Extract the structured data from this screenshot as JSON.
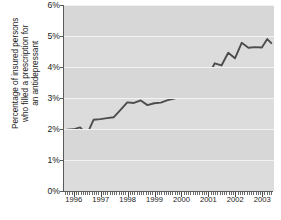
{
  "chart_data": {
    "type": "line",
    "title": "",
    "subtitle": "",
    "xlabel": "",
    "ylabel": "Percentage of insured persons who filled a prescription for an antidepressant",
    "ylabel_lines": [
      "Percentage of insured persons",
      "who filled a prescription for",
      "an antidepressant"
    ],
    "ylim": [
      0,
      6
    ],
    "ytick_labels": [
      "0%",
      "1%",
      "2%",
      "3%",
      "4%",
      "5%",
      "6%"
    ],
    "ytick_values": [
      0,
      1,
      2,
      3,
      4,
      5,
      6
    ],
    "xlim": [
      1995.6,
      2003.4
    ],
    "xtick_labels": [
      "1996",
      "1997",
      "1998",
      "1999",
      "2000",
      "2001",
      "2002",
      "2003"
    ],
    "xtick_values": [
      1996,
      1997,
      1998,
      1999,
      2000,
      2001,
      2002,
      2003
    ],
    "grid": "horizontal-white",
    "legend": "none",
    "line_color": "#4d4d4d",
    "plot_background": "#dcdcdc",
    "series": [
      {
        "name": "Percentage of insured persons filling an antidepressant prescription",
        "x": [
          1995.7,
          1995.95,
          1996.2,
          1996.45,
          1996.7,
          1996.95,
          1997.2,
          1997.45,
          1997.7,
          1997.95,
          1998.2,
          1998.45,
          1998.7,
          1998.95,
          1999.2,
          1999.45,
          1999.7,
          1999.95,
          2000.2,
          2000.45,
          2000.7,
          2000.95,
          2001.2,
          2001.45,
          2001.7,
          2001.95,
          2002.2,
          2002.45,
          2002.7,
          2002.95,
          2003.15,
          2003.3
        ],
        "values": [
          1.98,
          1.99,
          2.05,
          1.82,
          2.3,
          2.32,
          2.35,
          2.38,
          2.62,
          2.86,
          2.84,
          2.92,
          2.77,
          2.83,
          2.85,
          2.93,
          2.98,
          3.13,
          3.5,
          3.28,
          3.8,
          3.7,
          4.12,
          4.05,
          4.46,
          4.28,
          4.78,
          4.62,
          4.64,
          4.63,
          4.9,
          4.77
        ]
      }
    ]
  },
  "caption": {
    "cropped_text": ""
  }
}
